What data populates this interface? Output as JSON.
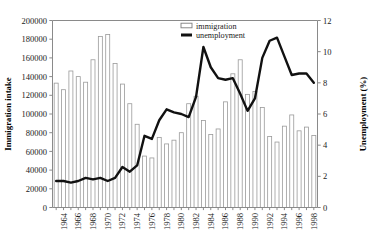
{
  "chart_data": {
    "type": "bar",
    "title": "",
    "xlabel": "",
    "ylabel": "Immigration intake",
    "y2label": "Unemployment (%)",
    "ylim": [
      0,
      200000
    ],
    "y2lim": [
      0,
      12
    ],
    "ytick_labels": [
      "0",
      "20000",
      "40000",
      "60000",
      "80000",
      "100000",
      "120000",
      "140000",
      "160000",
      "180000",
      "200000"
    ],
    "ytick_values": [
      0,
      20000,
      40000,
      60000,
      80000,
      100000,
      120000,
      140000,
      160000,
      180000,
      200000
    ],
    "y2tick_labels": [
      "0",
      "2",
      "4",
      "6",
      "8",
      "10",
      "12"
    ],
    "y2tick_values": [
      0,
      2,
      4,
      6,
      8,
      10,
      12
    ],
    "grid": false,
    "legend_position": "top-center-right",
    "categories": [
      1963,
      1964,
      1965,
      1966,
      1967,
      1968,
      1969,
      1970,
      1971,
      1972,
      1973,
      1974,
      1975,
      1976,
      1977,
      1978,
      1979,
      1980,
      1981,
      1982,
      1983,
      1984,
      1985,
      1986,
      1987,
      1988,
      1989,
      1990,
      1991,
      1992,
      1993,
      1994,
      1995,
      1996,
      1997,
      1998
    ],
    "xtick_labels": [
      "1964",
      "1966",
      "1968",
      "1970",
      "1972",
      "1974",
      "1976",
      "1978",
      "1980",
      "1982",
      "1984",
      "1986",
      "1988",
      "1990",
      "1992",
      "1994",
      "1996",
      "1998"
    ],
    "series": [
      {
        "name": "immigration",
        "type": "bar",
        "axis": "left",
        "values": [
          133000,
          126000,
          146000,
          140000,
          134000,
          158000,
          183000,
          185000,
          154000,
          132000,
          111000,
          89000,
          55000,
          53000,
          75000,
          68000,
          72000,
          80000,
          111000,
          119000,
          93000,
          78000,
          84000,
          113000,
          143000,
          158000,
          121000,
          124000,
          107000,
          76000,
          70000,
          87000,
          99000,
          82000,
          86000,
          77000
        ]
      },
      {
        "name": "unemployment",
        "type": "line",
        "axis": "right",
        "values": [
          1.7,
          1.7,
          1.6,
          1.7,
          1.9,
          1.8,
          1.9,
          1.7,
          1.9,
          2.6,
          2.3,
          2.7,
          4.6,
          4.4,
          5.6,
          6.3,
          6.1,
          6.0,
          5.8,
          7.1,
          10.3,
          9.0,
          8.3,
          8.2,
          8.3,
          7.3,
          6.2,
          7.0,
          9.6,
          10.7,
          10.9,
          9.7,
          8.5,
          8.6,
          8.6,
          8.0
        ]
      }
    ]
  },
  "legend": {
    "items": [
      {
        "label": "immigration",
        "marker": "open-bar",
        "color": "#ffffff"
      },
      {
        "label": "unemployment",
        "marker": "thick-line",
        "color": "#111111"
      }
    ]
  },
  "colors": {
    "bar_fill": "#ffffff",
    "bar_stroke": "#9a9a9a",
    "line": "#111111",
    "axis": "#8a8a8a",
    "text": "#1a1a1a",
    "background": "#ffffff"
  }
}
